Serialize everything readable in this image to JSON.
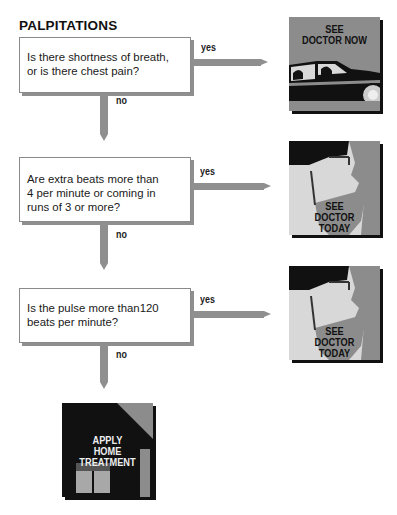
{
  "title": "PALPITATIONS",
  "steps": [
    {
      "question": "Is there shortness of breath, or is there chest pain?",
      "question_lines": [
        "Is there shortness of breath,",
        "or is there chest pain?"
      ],
      "yes_label": "yes",
      "no_label": "no",
      "outcome": {
        "text_lines": [
          "SEE",
          "DOCTOR NOW"
        ],
        "icon": "car-icon"
      }
    },
    {
      "question": "Are extra beats more than 4 per minute or coming in runs of 3 or more?",
      "question_lines": [
        "Are extra beats more than",
        "4 per minute or coming in",
        "runs of 3 or more?"
      ],
      "yes_label": "yes",
      "no_label": "no",
      "outcome": {
        "text_lines": [
          "SEE",
          "DOCTOR",
          "TODAY"
        ],
        "icon": "doctor-icon"
      }
    },
    {
      "question": "Is the pulse more than120 beats per minute?",
      "question_lines": [
        "Is the pulse more than120",
        "beats per minute?"
      ],
      "yes_label": "yes",
      "no_label": "no",
      "outcome": {
        "text_lines": [
          "SEE",
          "DOCTOR",
          "TODAY"
        ],
        "icon": "doctor-icon"
      }
    }
  ],
  "final": {
    "text_lines": [
      "APPLY",
      "HOME",
      "TREATMENT"
    ],
    "icon": "house-icon"
  },
  "colors": {
    "arrow": "#8f8f8f",
    "panel_gray": "#8c8c8c",
    "dark": "#111111",
    "light": "#d8d8d8"
  }
}
